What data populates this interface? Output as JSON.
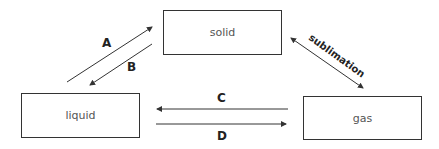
{
  "states": {
    "solid": "solid",
    "liquid": "liquid",
    "gas": "gas"
  },
  "arrows": {
    "a": "A",
    "b": "B",
    "c": "C",
    "d": "D",
    "sublimation": "sublimation"
  }
}
